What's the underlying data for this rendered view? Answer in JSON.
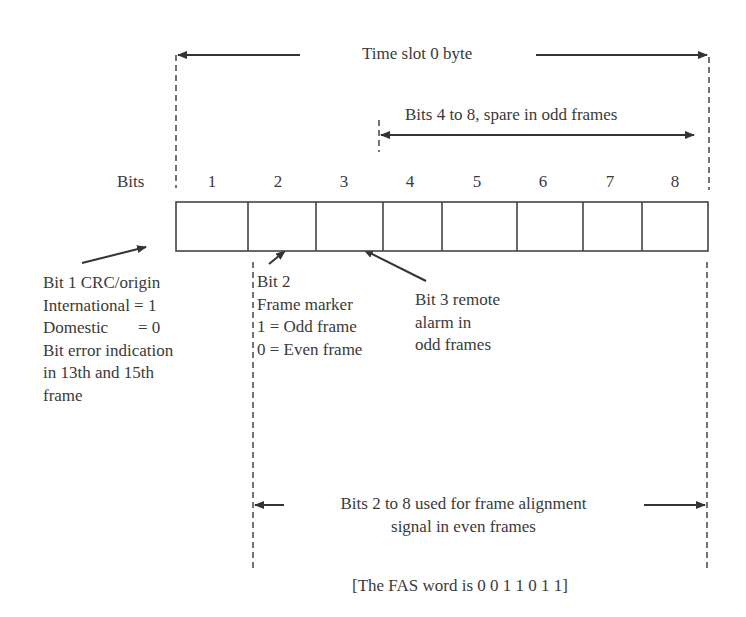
{
  "diagram": {
    "title_span": "Time slot 0 byte",
    "spare_span": "Bits 4 to 8, spare in odd frames",
    "bits_label": "Bits",
    "bit_numbers": [
      "1",
      "2",
      "3",
      "4",
      "5",
      "6",
      "7",
      "8"
    ],
    "bit1_note": {
      "lines": [
        "Bit 1 CRC/origin",
        "International = 1",
        "Domestic       = 0",
        "Bit error indication",
        "in 13th and 15th",
        "frame"
      ]
    },
    "bit2_note": {
      "lines": [
        "Bit 2",
        "Frame marker",
        "1 = Odd frame",
        "0 = Even frame"
      ]
    },
    "bit3_note": {
      "lines": [
        "Bit 3 remote",
        "alarm in",
        "odd frames"
      ]
    },
    "fas_span": {
      "lines": [
        "Bits 2 to 8 used for frame alignment",
        "signal in even frames"
      ]
    },
    "fas_word": "[The FAS word is 0 0 1 1 0 1 1]",
    "colors": {
      "ink": "#3a3a3a",
      "background": "#ffffff"
    }
  }
}
